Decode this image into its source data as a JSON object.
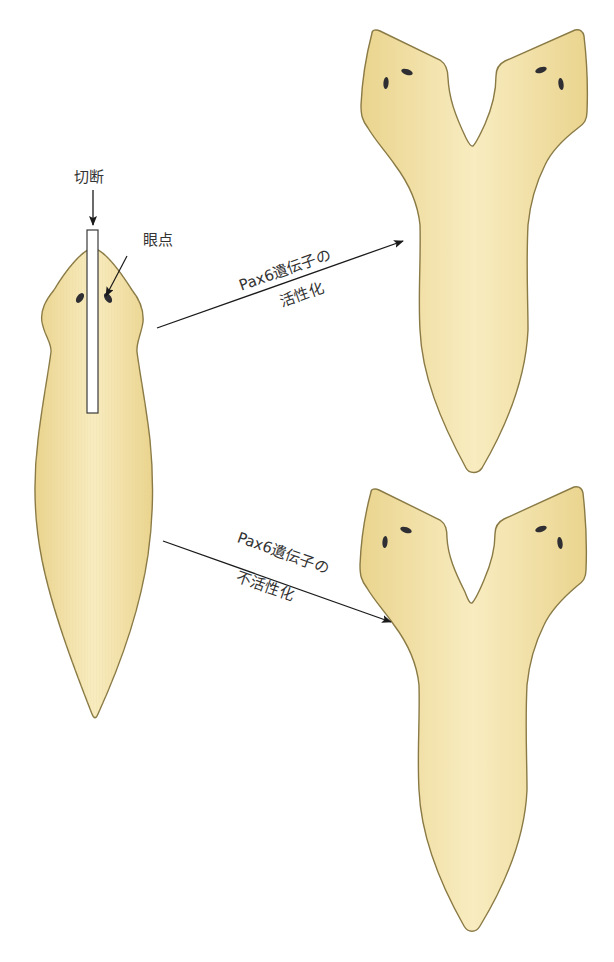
{
  "figure": {
    "labels": {
      "cut": "切断",
      "eyespot": "眼点",
      "activation_line1": "Pax6遺伝子の",
      "activation_line2": "活性化",
      "inactivation_line1": "Pax6遺伝子の",
      "inactivation_line2": "不活性化"
    },
    "colors": {
      "body_fill": "#f5e6b0",
      "body_edge": "#e8d28c",
      "body_outline": "#8a7a45",
      "eye": "#2e2e33",
      "arrow": "#1a1a1a",
      "cut_bar": "#ffffff"
    },
    "panels": [
      {
        "id": "original",
        "description": "planarian with vertical cut through head"
      },
      {
        "id": "activated",
        "description": "two-headed planarian with eyes (Pax6 activated)"
      },
      {
        "id": "inactivated",
        "description": "two-headed planarian (Pax6 inactivated)"
      }
    ]
  }
}
